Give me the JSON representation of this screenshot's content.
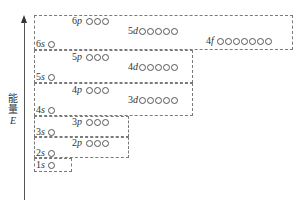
{
  "title": "",
  "axis": {
    "label_line1": "能",
    "label_line2": "量",
    "label_symbol": "E",
    "direction": "up"
  },
  "groups": [
    {
      "name": "group-6",
      "sublevels": [
        {
          "n": "6",
          "l": "s",
          "orbitals": 1
        },
        {
          "n": "4",
          "l": "f",
          "orbitals": 7
        },
        {
          "n": "5",
          "l": "d",
          "orbitals": 5
        },
        {
          "n": "6",
          "l": "p",
          "orbitals": 3
        }
      ]
    },
    {
      "name": "group-5",
      "sublevels": [
        {
          "n": "5",
          "l": "s",
          "orbitals": 1
        },
        {
          "n": "4",
          "l": "d",
          "orbitals": 5
        },
        {
          "n": "5",
          "l": "p",
          "orbitals": 3
        }
      ]
    },
    {
      "name": "group-4",
      "sublevels": [
        {
          "n": "4",
          "l": "s",
          "orbitals": 1
        },
        {
          "n": "3",
          "l": "d",
          "orbitals": 5
        },
        {
          "n": "4",
          "l": "p",
          "orbitals": 3
        }
      ]
    },
    {
      "name": "group-3",
      "sublevels": [
        {
          "n": "3",
          "l": "s",
          "orbitals": 1
        },
        {
          "n": "3",
          "l": "p",
          "orbitals": 3
        }
      ]
    },
    {
      "name": "group-2",
      "sublevels": [
        {
          "n": "2",
          "l": "s",
          "orbitals": 1
        },
        {
          "n": "2",
          "l": "p",
          "orbitals": 3
        }
      ]
    },
    {
      "name": "group-1",
      "sublevels": [
        {
          "n": "1",
          "l": "s",
          "orbitals": 1
        }
      ]
    }
  ],
  "labels": {
    "s6": {
      "n": "6",
      "l": "s"
    },
    "f4": {
      "n": "4",
      "l": "f"
    },
    "d5": {
      "n": "5",
      "l": "d"
    },
    "p6": {
      "n": "6",
      "l": "p"
    },
    "s5": {
      "n": "5",
      "l": "s"
    },
    "d4": {
      "n": "4",
      "l": "d"
    },
    "p5": {
      "n": "5",
      "l": "p"
    },
    "s4": {
      "n": "4",
      "l": "s"
    },
    "d3": {
      "n": "3",
      "l": "d"
    },
    "p4": {
      "n": "4",
      "l": "p"
    },
    "s3": {
      "n": "3",
      "l": "s"
    },
    "p3": {
      "n": "3",
      "l": "p"
    },
    "s2": {
      "n": "2",
      "l": "s"
    },
    "p2": {
      "n": "2",
      "l": "p"
    },
    "s1": {
      "n": "1",
      "l": "s"
    }
  }
}
